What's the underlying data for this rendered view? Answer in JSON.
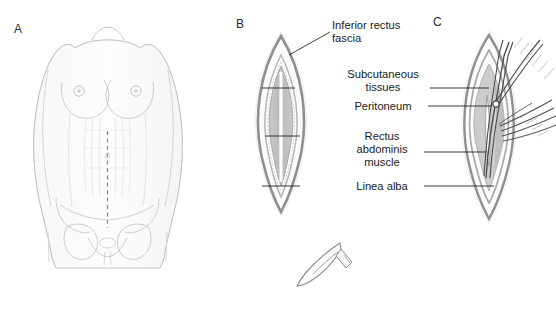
{
  "figure": {
    "background_color": "#ffffff",
    "line_color": "#6d6d6d",
    "text_color": "#1a1a1a",
    "leader_color": "#1a1a1a"
  },
  "panels": [
    {
      "id": "A",
      "letter": "A",
      "description": "Anterior view of female torso with dashed vertical midline incision marking"
    },
    {
      "id": "B",
      "letter": "B",
      "description": "Open lens-shaped incision showing concentric tissue layers"
    },
    {
      "id": "C",
      "letter": "C",
      "description": "Incision with surgical scissors and forceps dissecting the peritoneum"
    }
  ],
  "labels": [
    {
      "id": "inferior-rectus-fascia",
      "text": "Inferior rectus\nfascia",
      "align": "left"
    },
    {
      "id": "subcutaneous-tissues",
      "text": "Subcutaneous\ntissues",
      "align": "center"
    },
    {
      "id": "peritoneum",
      "text": "Peritoneum",
      "align": "center"
    },
    {
      "id": "rectus-abdominis-muscle",
      "text": "Rectus\nabdominis\nmuscle",
      "align": "center"
    },
    {
      "id": "linea-alba",
      "text": "Linea alba",
      "align": "center"
    }
  ],
  "instruments": [
    {
      "id": "scalpel",
      "name": "scalpel-blade"
    },
    {
      "id": "scissors",
      "name": "surgical-scissors"
    },
    {
      "id": "forceps",
      "name": "surgical-forceps"
    }
  ]
}
